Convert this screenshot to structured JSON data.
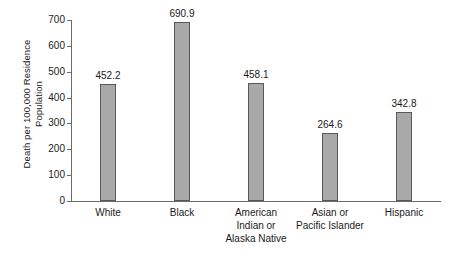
{
  "chart_data": {
    "type": "bar",
    "title": "",
    "xlabel": "",
    "ylabel": "Death per 100,000 Residence Population",
    "ylabel_lines": [
      "Death per 100,000 Residence",
      "Population"
    ],
    "categories": [
      "White",
      "Black",
      "American Indian or Alaska Native",
      "Asian or Pacific Islander",
      "Hispanic"
    ],
    "category_lines": [
      [
        "White"
      ],
      [
        "Black"
      ],
      [
        "American",
        "Indian or",
        "Alaska Native"
      ],
      [
        "Asian or",
        "Pacific Islander"
      ],
      [
        "Hispanic"
      ]
    ],
    "values": [
      452.2,
      690.9,
      458.1,
      264.6,
      342.8
    ],
    "value_labels": [
      "452.2",
      "690.9",
      "458.1",
      "264.6",
      "342.8"
    ],
    "ylim": [
      0,
      700
    ],
    "ytick_values": [
      0,
      100,
      200,
      300,
      400,
      500,
      600,
      700
    ],
    "ytick_labels": [
      "0",
      "100",
      "200",
      "300",
      "400",
      "500",
      "600",
      "700"
    ],
    "grid": false,
    "legend": null,
    "colors": {
      "bar_fill": "#a9a9a9",
      "bar_border": "#595959",
      "axis": "#6b6b6b",
      "text": "#1a1a1a",
      "background": "#ffffff"
    }
  }
}
